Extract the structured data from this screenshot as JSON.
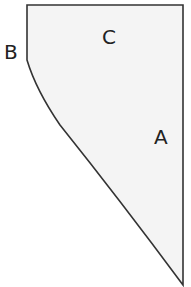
{
  "diagram": {
    "type": "polygon-shape",
    "fill_color": "#f4f4f4",
    "stroke_color": "#333333",
    "vertices": [
      [
        27,
        5
      ],
      [
        183,
        5
      ],
      [
        183,
        285
      ],
      [
        27,
        60
      ]
    ],
    "labels": {
      "a": "A",
      "b": "B",
      "c": "C"
    }
  }
}
